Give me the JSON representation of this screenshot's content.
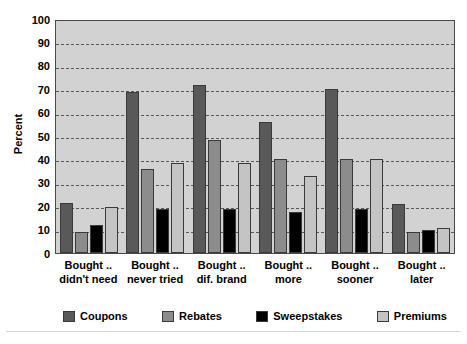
{
  "chart_data": {
    "type": "bar",
    "title": "",
    "xlabel": "",
    "ylabel": "Percent",
    "ylim": [
      0,
      100
    ],
    "ytick_step": 10,
    "yticks": [
      100,
      90,
      80,
      70,
      60,
      50,
      40,
      30,
      20,
      10,
      0
    ],
    "grid": true,
    "grid_style": "dashed-horizontal",
    "legend_position": "bottom",
    "categories": [
      "Bought .. didn't need",
      "Bought .. never tried",
      "Bought .. dif. brand",
      "Bought .. more",
      "Bought .. sooner",
      "Bought .. later"
    ],
    "category_lines": [
      [
        "Bought ..",
        "didn't need"
      ],
      [
        "Bought ..",
        "never tried"
      ],
      [
        "Bought ..",
        "dif. brand"
      ],
      [
        "Bought ..",
        "more"
      ],
      [
        "Bought ..",
        "sooner"
      ],
      [
        "Bought ..",
        "later"
      ]
    ],
    "series": [
      {
        "name": "Coupons",
        "color": "#595959",
        "values": [
          21.5,
          69,
          72,
          56,
          70,
          21
        ]
      },
      {
        "name": "Rebates",
        "color": "#8c8c8c",
        "values": [
          9,
          36,
          48.5,
          40,
          40,
          9
        ]
      },
      {
        "name": "Sweepstakes",
        "color": "#000000",
        "values": [
          12,
          19,
          19,
          17.5,
          19,
          10
        ]
      },
      {
        "name": "Premiums",
        "color": "#c4c4c4",
        "values": [
          19.5,
          38.5,
          38.5,
          33,
          40,
          10.5
        ]
      }
    ]
  },
  "style": {
    "plot_background": "#d2d2d2",
    "plot_border": "#4a4a4a",
    "gridline_color": "#5a5a5a",
    "page_background": "#ffffff",
    "text_color": "#000000"
  }
}
